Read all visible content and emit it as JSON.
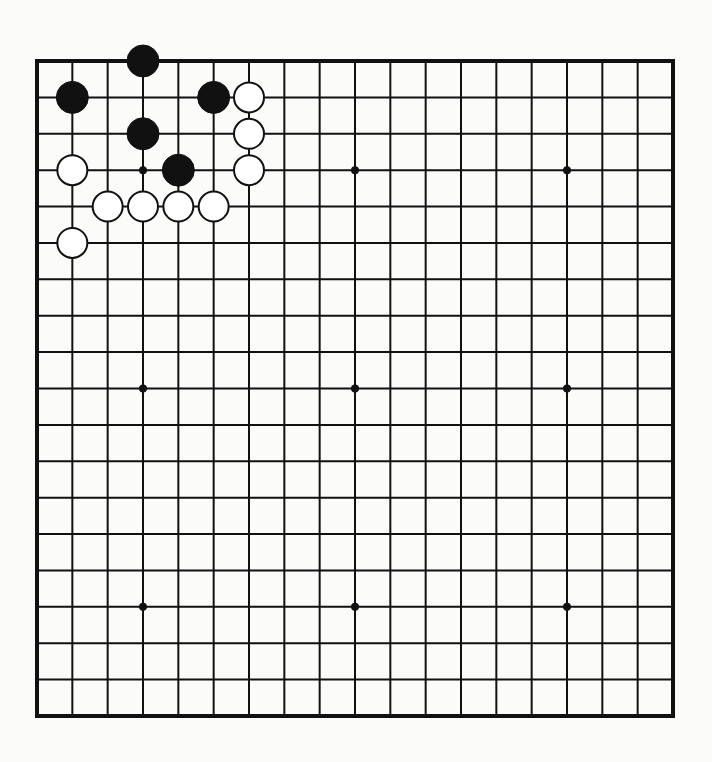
{
  "board": {
    "size": 19,
    "left": 37,
    "top": 61,
    "right": 673,
    "bottom": 716,
    "line_color": "#111111",
    "border_width": 4,
    "line_width": 2,
    "stone_radius": 16,
    "hoshi_radius": 4,
    "hoshi": [
      [
        3,
        3
      ],
      [
        9,
        3
      ],
      [
        15,
        3
      ],
      [
        3,
        9
      ],
      [
        9,
        9
      ],
      [
        15,
        9
      ],
      [
        3,
        15
      ],
      [
        9,
        15
      ],
      [
        15,
        15
      ]
    ]
  },
  "stones": [
    {
      "color": "black",
      "col": 3,
      "row": 0
    },
    {
      "color": "black",
      "col": 1,
      "row": 1
    },
    {
      "color": "black",
      "col": 5,
      "row": 1
    },
    {
      "color": "white",
      "col": 6,
      "row": 1
    },
    {
      "color": "black",
      "col": 3,
      "row": 2
    },
    {
      "color": "white",
      "col": 6,
      "row": 2
    },
    {
      "color": "white",
      "col": 1,
      "row": 3
    },
    {
      "color": "black",
      "col": 4,
      "row": 3
    },
    {
      "color": "white",
      "col": 6,
      "row": 3
    },
    {
      "color": "white",
      "col": 2,
      "row": 4
    },
    {
      "color": "white",
      "col": 3,
      "row": 4
    },
    {
      "color": "white",
      "col": 4,
      "row": 4
    },
    {
      "color": "white",
      "col": 5,
      "row": 4
    },
    {
      "color": "white",
      "col": 1,
      "row": 5
    }
  ],
  "colors": {
    "black_stone": "#111111",
    "white_stone": "#ffffff",
    "background": "#fbfbfa"
  }
}
